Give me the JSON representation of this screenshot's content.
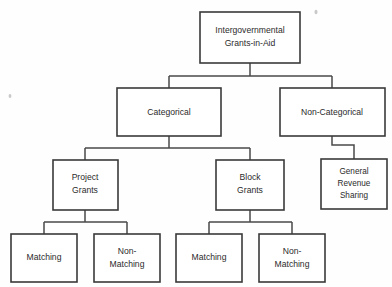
{
  "diagram": {
    "title": "Intergovernmental Grants-in-Aid",
    "type": "hierarchy-tree",
    "orientation": "top-down",
    "colors": {
      "background": "#fefefe",
      "box_fill": "#ffffff",
      "box_stroke": "#3a3a3a",
      "connector": "#4a4a4a",
      "text": "#2b2b2b"
    },
    "nodes": {
      "root": {
        "id": "intergovernmental-grants-in-aid",
        "line1": "Intergovernmental",
        "line2": "Grants-in-Aid",
        "level": 0
      },
      "categorical": {
        "id": "categorical",
        "line1": "Categorical",
        "level": 1
      },
      "non_categorical": {
        "id": "non-categorical",
        "line1": "Non-Categorical",
        "level": 1
      },
      "project_grants": {
        "id": "project-grants",
        "line1": "Project",
        "line2": "Grants",
        "level": 2
      },
      "block_grants": {
        "id": "block-grants",
        "line1": "Block",
        "line2": "Grants",
        "level": 2
      },
      "general_revenue_sharing": {
        "id": "general-revenue-sharing",
        "line1": "General",
        "line2": "Revenue",
        "line3": "Sharing",
        "level": 2
      },
      "project_matching": {
        "id": "project-matching",
        "line1": "Matching",
        "level": 3
      },
      "project_non_matching": {
        "id": "project-non-matching",
        "line1": "Non-",
        "line2": "Matching",
        "level": 3
      },
      "block_matching": {
        "id": "block-matching",
        "line1": "Matching",
        "level": 3
      },
      "block_non_matching": {
        "id": "block-non-matching",
        "line1": "Non-",
        "line2": "Matching",
        "level": 3
      }
    },
    "edges": [
      {
        "from": "intergovernmental-grants-in-aid",
        "to": "categorical"
      },
      {
        "from": "intergovernmental-grants-in-aid",
        "to": "non-categorical"
      },
      {
        "from": "categorical",
        "to": "project-grants"
      },
      {
        "from": "categorical",
        "to": "block-grants"
      },
      {
        "from": "non-categorical",
        "to": "general-revenue-sharing"
      },
      {
        "from": "project-grants",
        "to": "project-matching"
      },
      {
        "from": "project-grants",
        "to": "project-non-matching"
      },
      {
        "from": "block-grants",
        "to": "block-matching"
      },
      {
        "from": "block-grants",
        "to": "block-non-matching"
      }
    ]
  }
}
